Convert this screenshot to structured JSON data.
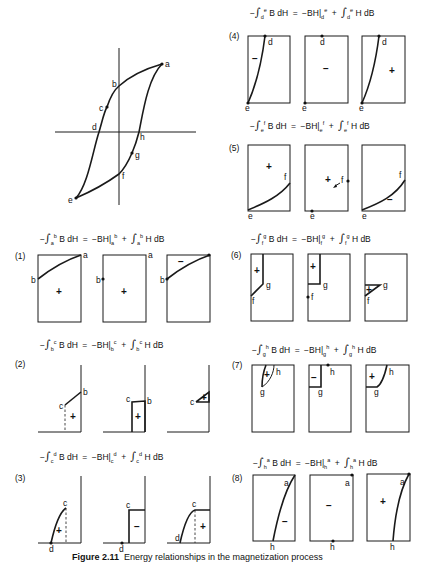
{
  "figure": {
    "caption_label": "Figure 2.11",
    "caption_text": "Energy relationships in the magnetization process"
  },
  "loop": {
    "points": {
      "a": "a",
      "b": "b",
      "c": "c",
      "d": "d",
      "e": "e",
      "f": "f",
      "g": "g",
      "h": "h"
    }
  },
  "panels": [
    {
      "num": "(1)",
      "from": "a",
      "to": "b",
      "lhs": "B dH",
      "mid": "BH",
      "rhs": "H dB",
      "signs": [
        "+",
        "+",
        "−"
      ]
    },
    {
      "num": "(2)",
      "from": "b",
      "to": "c",
      "lhs": "B dH",
      "mid": "BH",
      "rhs": "H dB",
      "signs": [
        "+",
        "+",
        "+"
      ]
    },
    {
      "num": "(3)",
      "from": "c",
      "to": "d",
      "lhs": "B dH",
      "mid": "BH",
      "rhs": "H dB",
      "signs": [
        "+",
        "−",
        "+"
      ]
    },
    {
      "num": "(4)",
      "from": "d",
      "to": "e",
      "lhs": "B dH",
      "mid": "BH",
      "rhs": "H dB",
      "signs": [
        "−",
        "−",
        "+"
      ]
    },
    {
      "num": "(5)",
      "from": "e",
      "to": "f",
      "lhs": "B dH",
      "mid": "BH",
      "rhs": "H dB",
      "signs": [
        "+",
        "+",
        "−"
      ]
    },
    {
      "num": "(6)",
      "from": "f",
      "to": "g",
      "lhs": "B dH",
      "mid": "BH",
      "rhs": "H dB",
      "signs": [
        "+",
        "+",
        "+"
      ]
    },
    {
      "num": "(7)",
      "from": "g",
      "to": "h",
      "lhs": "B dH",
      "mid": "BH",
      "rhs": "H dB",
      "signs": [
        "+",
        "−",
        "+"
      ]
    },
    {
      "num": "(8)",
      "from": "h",
      "to": "a",
      "lhs": "B dH",
      "mid": "BH",
      "rhs": "H dB",
      "signs": [
        "−",
        "−",
        "+"
      ]
    }
  ],
  "symbols": {
    "minus": "−",
    "equals": "=",
    "plus": "+",
    "integral": "∫",
    "bar": "|"
  }
}
